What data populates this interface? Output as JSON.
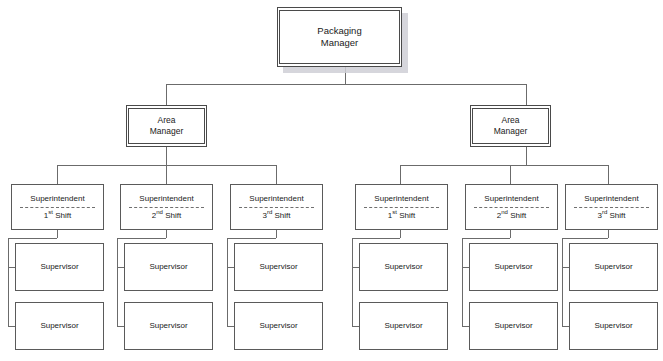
{
  "chart": {
    "background_color": "#ffffff",
    "line_color": "#6b6b6b",
    "box_border_color": "#4a4a4a",
    "shadow_color": "#cfcfd6"
  },
  "root": {
    "line1": "Packaging",
    "line2": "Manager"
  },
  "area_managers": [
    {
      "line1": "Area",
      "line2": "Manager"
    },
    {
      "line1": "Area",
      "line2": "Manager"
    }
  ],
  "superintendents": [
    {
      "title": "Superintendent",
      "shift_num": "1",
      "shift_ord": "st",
      "shift_word": "Shift"
    },
    {
      "title": "Superintendent",
      "shift_num": "2",
      "shift_ord": "nd",
      "shift_word": "Shift"
    },
    {
      "title": "Superintendent",
      "shift_num": "3",
      "shift_ord": "rd",
      "shift_word": "Shift"
    },
    {
      "title": "Superintendent",
      "shift_num": "1",
      "shift_ord": "st",
      "shift_word": "Shift"
    },
    {
      "title": "Superintendent",
      "shift_num": "2",
      "shift_ord": "nd",
      "shift_word": "Shift"
    },
    {
      "title": "Superintendent",
      "shift_num": "3",
      "shift_ord": "rd",
      "shift_word": "Shift"
    }
  ],
  "supervisors": [
    {
      "label": "Supervisor"
    },
    {
      "label": "Supervisor"
    },
    {
      "label": "Supervisor"
    },
    {
      "label": "Supervisor"
    },
    {
      "label": "Supervisor"
    },
    {
      "label": "Supervisor"
    },
    {
      "label": "Supervisor"
    },
    {
      "label": "Supervisor"
    },
    {
      "label": "Supervisor"
    },
    {
      "label": "Supervisor"
    },
    {
      "label": "Supervisor"
    },
    {
      "label": "Supervisor"
    }
  ]
}
